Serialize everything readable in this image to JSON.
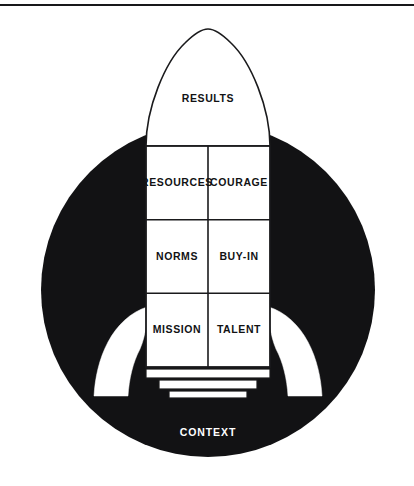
{
  "figure": {
    "title_visible": false,
    "type": "rocket-framework-diagram",
    "colors": {
      "background": "#ffffff",
      "circle_fill": "#121214",
      "rocket_fill": "#ffffff",
      "rocket_stroke": "#1a1a1c",
      "label_dark": "#121214",
      "label_light": "#ffffff",
      "rule": "#18181a"
    },
    "top_rule": {
      "present": true
    },
    "circle": {
      "label": "CONTEXT",
      "label_color": "#ffffff"
    },
    "nose_cone": {
      "label": "RESULTS"
    },
    "body_grid": {
      "columns": 2,
      "rows": 3,
      "cells": [
        {
          "label": "RESOURCES",
          "row": 1,
          "col": 1
        },
        {
          "label": "COURAGE",
          "row": 1,
          "col": 2
        },
        {
          "label": "NORMS",
          "row": 2,
          "col": 1
        },
        {
          "label": "BUY-IN",
          "row": 2,
          "col": 2
        },
        {
          "label": "MISSION",
          "row": 3,
          "col": 1
        },
        {
          "label": "TALENT",
          "row": 3,
          "col": 2
        }
      ]
    },
    "fins": {
      "count": 2,
      "names": [
        "left-fin",
        "right-fin"
      ]
    },
    "engine": {
      "segments": 3
    }
  }
}
